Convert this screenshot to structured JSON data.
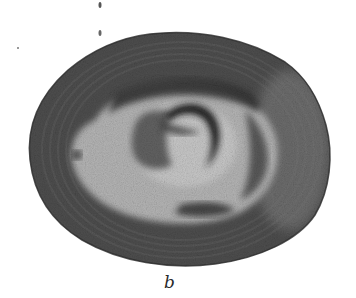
{
  "figure": {
    "panel_label": "b",
    "colors": {
      "background": "#ffffff",
      "outer_cortex": "#4a4a4a",
      "light_zone": "#b8b8b8",
      "dark_band": "#333333",
      "nucleus_crescent": "#2e2e2e",
      "nucleus_core": "#a8a8a8"
    }
  }
}
